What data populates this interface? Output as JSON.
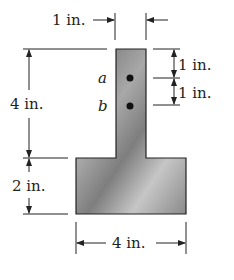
{
  "diagram": {
    "type": "T-section cross-section",
    "labels": {
      "top_width": "1 in.",
      "stem_height": "4 in.",
      "flange_height": "2 in.",
      "flange_width": "4 in.",
      "a_offset": "1 in.",
      "b_offset": "1 in.",
      "point_a": "a",
      "point_b": "b"
    },
    "colors": {
      "section_dark": "#5a5a5a",
      "section_light": "#cfcfcf",
      "outline": "#222222",
      "text": "#222222"
    }
  }
}
